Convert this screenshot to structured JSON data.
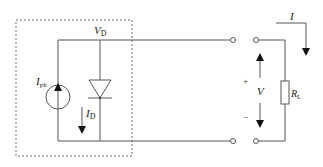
{
  "diagram": {
    "type": "equivalent-circuit",
    "colors": {
      "wire": "#555555",
      "dashed_box": "#666666",
      "text": "#222222",
      "background": "#ffffff"
    },
    "labels": {
      "vd_main": "V",
      "vd_sub": "D",
      "iph_main": "I",
      "iph_sub": "ph",
      "id_main": "I",
      "id_sub": "D",
      "v": "V",
      "plus": "+",
      "minus": "−",
      "rl_main": "R",
      "rl_sub": "L",
      "i": "I"
    },
    "components": [
      {
        "id": "photocurrent-source",
        "label": "I_ph",
        "kind": "current source"
      },
      {
        "id": "diode",
        "label": "V_D",
        "kind": "diode"
      },
      {
        "id": "load-resistor",
        "label": "R_L",
        "kind": "resistor"
      },
      {
        "id": "terminals",
        "kind": "open terminals",
        "count": 4
      }
    ]
  }
}
